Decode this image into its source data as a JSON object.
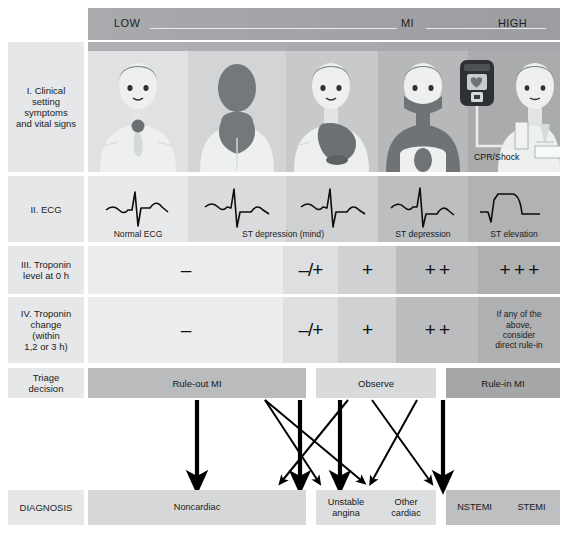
{
  "figure": {
    "risk_scale": {
      "low": "LOW",
      "mid": "MI",
      "high": "HIGH"
    }
  },
  "row_labels": {
    "clinical": "I. Clinical setting symptoms and vital signs",
    "clinical_lines": [
      "I. Clinical",
      "setting",
      "symptoms",
      "and vital signs"
    ],
    "ecg": "II. ECG",
    "troponin_level": "III. Troponin level at 0 h",
    "troponin_level_lines": [
      "III. Troponin",
      "level at 0 h"
    ],
    "troponin_change": "IV. Troponin change (within 1,2 or 3 h)",
    "troponin_change_lines": [
      "IV. Troponin",
      "change",
      "(within",
      "1,2 or 3 h)"
    ],
    "triage": "Triage decision",
    "triage_lines": [
      "Triage",
      "decision"
    ],
    "diagnosis": "DIAGNOSIS"
  },
  "clinical_row": {
    "cpr_caption": "CPR/Shock",
    "panels": [
      {
        "name": "chest-pain-front",
        "bg": "#dfe1e2"
      },
      {
        "name": "back-pain-figure",
        "bg": "#d2d4d6"
      },
      {
        "name": "large-chest-pain",
        "bg": "#c7c9cb"
      },
      {
        "name": "diffuse-pain-figure",
        "bg": "#b6b8ba"
      },
      {
        "name": "defibrillator-figure",
        "bg": "#a9abad"
      }
    ]
  },
  "ecg_row": {
    "cells": [
      {
        "label": "Normal ECG",
        "trace": "normal",
        "bg": "#e7e8e9"
      },
      {
        "label": "ST depression (mind)",
        "trace": "st-depression",
        "bg": "#dadcdd"
      },
      {
        "label": "",
        "trace": "st-depression",
        "bg": "#cfd1d3"
      },
      {
        "label": "ST depression",
        "trace": "st-depression",
        "bg": "#bcbec0"
      },
      {
        "label": "ST elevation",
        "trace": "st-elevation",
        "bg": "#b0b2b4"
      }
    ]
  },
  "troponin_level_row": {
    "cells": [
      {
        "value": "–",
        "bg": "#eceded"
      },
      {
        "value": "–/+",
        "bg": "#dedfe0"
      },
      {
        "value": "+",
        "bg": "#cfd1d2"
      },
      {
        "value": "+ +",
        "bg": "#babcbe"
      },
      {
        "value": "+ + +",
        "bg": "#aeb0b2"
      }
    ]
  },
  "troponin_change_row": {
    "cells": [
      {
        "value": "–",
        "note": "",
        "bg": "#eceded"
      },
      {
        "value": "–/+",
        "note": "",
        "bg": "#dedfe0"
      },
      {
        "value": "+",
        "note": "",
        "bg": "#cfd1d2"
      },
      {
        "value": "+ +",
        "note": "",
        "bg": "#babcbe"
      },
      {
        "value": "",
        "note": "If any of the above, consider direct rule-in",
        "bg": "#aeb0b2"
      }
    ],
    "note_lines": [
      "If any of the",
      "above,",
      "consider",
      "direct rule-in"
    ]
  },
  "triage_row": {
    "boxes": [
      {
        "label": "Rule-out MI",
        "bg": "#b9bbbd"
      },
      {
        "label": "Observe",
        "bg": "#d8dadb"
      },
      {
        "label": "Rule-in MI",
        "bg": "#a4a6a8"
      }
    ]
  },
  "diagnosis_row": {
    "boxes": [
      {
        "label": "Noncardiac",
        "bg": "#d6d8d9"
      }
    ],
    "middle": {
      "bg": "#dcdee0",
      "items": [
        {
          "lines": [
            "Unstable",
            "angina"
          ]
        },
        {
          "lines": [
            "Other",
            "cardiac"
          ]
        }
      ]
    },
    "right": {
      "bg": "#bdbfc1",
      "items": [
        {
          "label": "NSTEMI"
        },
        {
          "label": "STEMI"
        }
      ]
    }
  },
  "colors": {
    "row_label_bg": "#e6e7e8",
    "page_bg": "#ffffff",
    "text": "#1b1b1b",
    "arrow": "#000000"
  }
}
